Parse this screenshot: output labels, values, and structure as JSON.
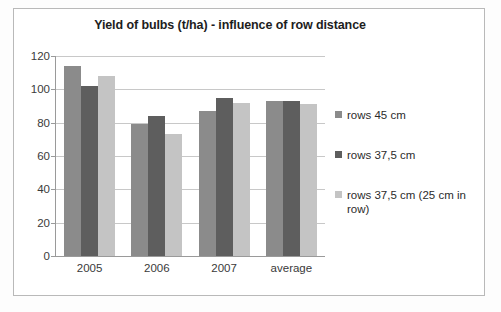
{
  "chart_data": {
    "type": "bar",
    "title": "Yield of bulbs (t/ha) - influence of row distance",
    "xlabel": "",
    "ylabel": "",
    "categories": [
      "2005",
      "2006",
      "2007",
      "average"
    ],
    "series": [
      {
        "name": "rows 45 cm",
        "color": "#8b8b8b",
        "values": [
          114,
          79,
          87,
          93
        ]
      },
      {
        "name": "rows 37,5 cm",
        "color": "#5e5e5e",
        "values": [
          102,
          84,
          95,
          93
        ]
      },
      {
        "name": "rows 37,5 cm (25 cm in row)",
        "color": "#c4c4c4",
        "values": [
          108,
          73,
          92,
          91
        ]
      }
    ],
    "ylim": [
      0,
      120
    ],
    "yticks": [
      0,
      20,
      40,
      60,
      80,
      100,
      120
    ],
    "ytick_labels": [
      "0",
      "20",
      "40",
      "60",
      "80",
      "100",
      "120"
    ],
    "grid": true,
    "legend_position": "right"
  }
}
